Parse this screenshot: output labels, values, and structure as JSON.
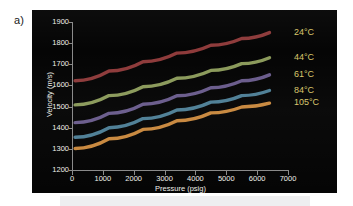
{
  "figure": {
    "panel_label": "a)",
    "background_color": "#ffffff",
    "plot_background_color": "#050505",
    "text_color": "#efefe9",
    "axis_color": "#8a8a8a"
  },
  "chart_data": {
    "type": "line",
    "title": "",
    "xlabel": "Pressure (psig)",
    "ylabel": "Velocity (m/s)",
    "xlim": [
      0,
      7000
    ],
    "ylim": [
      1200,
      1900
    ],
    "xticks": [
      0,
      1000,
      2000,
      3000,
      4000,
      5000,
      6000,
      7000
    ],
    "yticks": [
      1200,
      1300,
      1400,
      1500,
      1600,
      1700,
      1800,
      1900
    ],
    "grid": false,
    "legend_position": "right-outside-labels",
    "series": [
      {
        "name": "24°C",
        "color": "#8e3b3b",
        "label": "24°C",
        "x": [
          100,
          1200,
          2300,
          3400,
          4500,
          5500,
          6400
        ],
        "y": [
          1622,
          1668,
          1712,
          1753,
          1790,
          1822,
          1850
        ]
      },
      {
        "name": "44°C",
        "color": "#8b9a5b",
        "label": "44°C",
        "x": [
          100,
          1200,
          2300,
          3400,
          4500,
          5500,
          6400
        ],
        "y": [
          1508,
          1552,
          1594,
          1634,
          1671,
          1703,
          1731
        ]
      },
      {
        "name": "61°C",
        "color": "#6a5c8c",
        "label": "61°C",
        "x": [
          100,
          1200,
          2300,
          3400,
          4500,
          5500,
          6400
        ],
        "y": [
          1424,
          1468,
          1511,
          1551,
          1589,
          1622,
          1650
        ]
      },
      {
        "name": "84°C",
        "color": "#4e7f96",
        "label": "84°C",
        "x": [
          100,
          1200,
          2300,
          3400,
          4500,
          5500,
          6400
        ],
        "y": [
          1355,
          1400,
          1443,
          1484,
          1521,
          1552,
          1576
        ]
      },
      {
        "name": "105°C",
        "color": "#c8883e",
        "label": "105°C",
        "x": [
          100,
          1200,
          2300,
          3400,
          4500,
          5500,
          6400
        ],
        "y": [
          1302,
          1348,
          1392,
          1433,
          1470,
          1498,
          1516
        ]
      }
    ]
  }
}
